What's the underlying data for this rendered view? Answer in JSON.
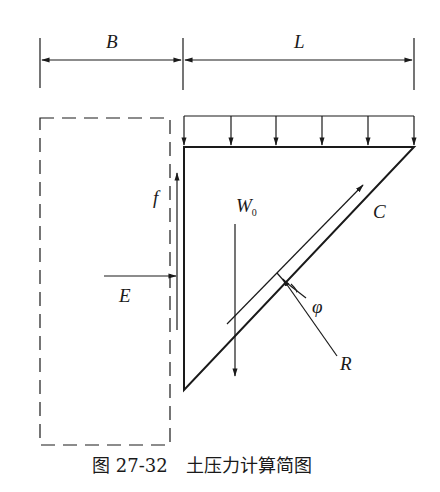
{
  "figure": {
    "caption_number": "图 27-32",
    "caption_title": "土压力计算简图"
  },
  "dimensions": {
    "left_label": "B",
    "right_label": "L"
  },
  "forces": {
    "friction_label": "f",
    "earth_pressure_label": "E",
    "weight_label": "W",
    "weight_subscript": "0",
    "cohesion_label": "C",
    "reaction_label": "R",
    "friction_angle_label": "φ"
  },
  "colors": {
    "line": "#1a1a1a",
    "background": "#ffffff"
  }
}
